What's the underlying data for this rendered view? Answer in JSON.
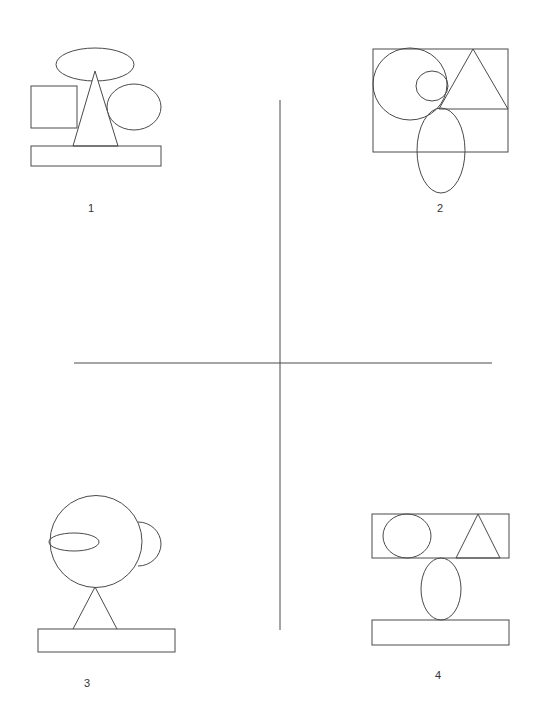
{
  "diagram": {
    "stroke_color": "#4a4a4a",
    "background": "#ffffff",
    "figures": [
      {
        "label": "1",
        "shapes": [
          "ellipse",
          "triangle",
          "square",
          "circle",
          "rectangle-base"
        ]
      },
      {
        "label": "2",
        "shapes": [
          "rectangle-frame",
          "large-circle",
          "small-circle",
          "triangle",
          "tall-ellipse"
        ]
      },
      {
        "label": "3",
        "shapes": [
          "large-circle",
          "side-circle",
          "ellipse",
          "triangle",
          "rectangle-base"
        ]
      },
      {
        "label": "4",
        "shapes": [
          "top-rectangle",
          "circle",
          "triangle",
          "ellipse",
          "bottom-rectangle"
        ]
      }
    ]
  }
}
